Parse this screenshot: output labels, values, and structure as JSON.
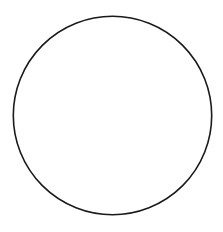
{
  "figure": {
    "title": "Hatched vertical bands inside a circle",
    "canvas": {
      "width": 223,
      "height": 232,
      "background_color": "#ffffff"
    },
    "circle": {
      "name": "outer-circle",
      "center_x": 112.5,
      "center_y": 115.5,
      "radius": 100,
      "stroke_color": "#1a1a1a",
      "stroke_width": 1.6,
      "fill_color": "#ffffff"
    },
    "hatching": {
      "angle_degrees": 45,
      "direction": "lower-left to upper-right",
      "spacing_px": 7,
      "stroke_color": "#333333",
      "stroke_width": 0.9
    },
    "band_style": {
      "edge_stroke_color": "#1a1a1a",
      "edge_stroke_width": 1.6,
      "fill_color": "#ffffff"
    },
    "bands": [
      {
        "id": "band-1",
        "label": "Band 1",
        "x_start": 23,
        "x_end": 38,
        "width": 15
      },
      {
        "id": "band-2",
        "label": "Band 2",
        "x_start": 56,
        "x_end": 80,
        "width": 24
      },
      {
        "id": "band-3",
        "label": "Band 3",
        "x_start": 101,
        "x_end": 130,
        "width": 29
      },
      {
        "id": "band-4",
        "label": "Band 4",
        "x_start": 155,
        "x_end": 182,
        "width": 27
      },
      {
        "id": "band-5",
        "label": "Band 5",
        "x_start": 200,
        "x_end": 212,
        "width": 12
      }
    ],
    "gaps": [
      {
        "id": "gap-1",
        "label": "Gap 1",
        "x_start": 38,
        "x_end": 56
      },
      {
        "id": "gap-2",
        "label": "Gap 2",
        "x_start": 80,
        "x_end": 101
      },
      {
        "id": "gap-3",
        "label": "Gap 3",
        "x_start": 130,
        "x_end": 155
      },
      {
        "id": "gap-4",
        "label": "Gap 4",
        "x_start": 182,
        "x_end": 200
      }
    ],
    "counts": {
      "band_count": 5,
      "gap_count": 4
    }
  }
}
